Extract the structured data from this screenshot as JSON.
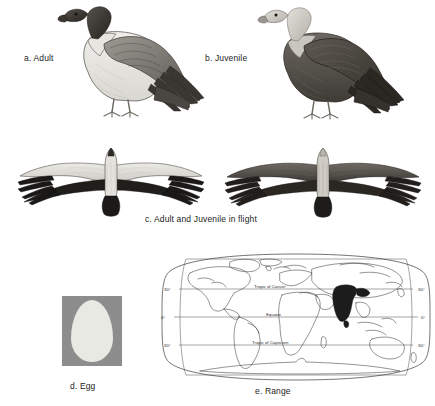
{
  "plate": {
    "title": "Vulture species identification plate",
    "background_color": "#ffffff",
    "ink_color": "#2b2b2b"
  },
  "panels": [
    {
      "key": "a",
      "label": "a. Adult",
      "subject": "adult-vulture-perched",
      "plumage": "pale body, dark brown wings, dark bare head and neck"
    },
    {
      "key": "b",
      "label": "b. Juvenile",
      "subject": "juvenile-vulture-perched",
      "plumage": "overall dark brown, pale downy head and neck"
    },
    {
      "key": "c",
      "label": "c. Adult and Juvenile in flight",
      "subject": "two-vultures-in-flight-from-below",
      "plumage": "adult pale-bodied with dark flight feathers; juvenile uniformly dark"
    },
    {
      "key": "d",
      "label": "d. Egg",
      "subject": "egg-specimen",
      "egg_color": "#e9e9e4",
      "swatch_color": "#8d8d8d"
    },
    {
      "key": "e",
      "label": "e. Range",
      "subject": "world-range-map"
    }
  ],
  "map": {
    "projection": "oval world projection",
    "range_region": "Indian subcontinent",
    "range_color": "#1c1c1c",
    "graticule_labels_left": [
      "30°",
      "0°",
      "30°"
    ],
    "graticule_labels_right": [
      "30°",
      "0°",
      "30°"
    ],
    "line_labels": [
      "Tropic of Cancer",
      "Equator",
      "Tropic of Capricorn"
    ]
  },
  "footer": {
    "cut_text": ""
  }
}
